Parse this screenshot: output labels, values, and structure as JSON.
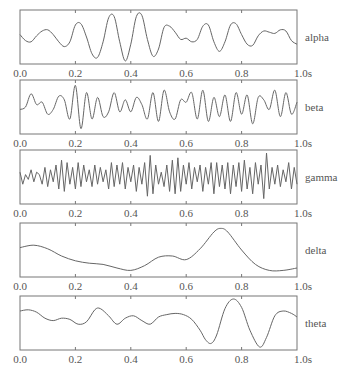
{
  "chart_data": {
    "type": "line",
    "title": "",
    "xlabel": "",
    "ylabel": "",
    "x_unit": "s",
    "xlim": [
      0.0,
      1.0
    ],
    "x_ticks": [
      0.0,
      0.2,
      0.4,
      0.6,
      0.8,
      1.0
    ],
    "x_tick_labels": [
      "0.0",
      "0.2",
      "0.4",
      "0.6",
      "0.8",
      "1.0s"
    ],
    "grid": false,
    "legend": "right-side labels per panel",
    "line_color": "#666666",
    "series": [
      {
        "name": "alpha",
        "x": [
          0.0,
          0.02,
          0.04,
          0.06,
          0.08,
          0.1,
          0.12,
          0.14,
          0.16,
          0.18,
          0.2,
          0.22,
          0.24,
          0.26,
          0.28,
          0.3,
          0.32,
          0.34,
          0.36,
          0.38,
          0.4,
          0.42,
          0.44,
          0.46,
          0.48,
          0.5,
          0.52,
          0.54,
          0.56,
          0.58,
          0.6,
          0.62,
          0.64,
          0.66,
          0.68,
          0.7,
          0.72,
          0.74,
          0.76,
          0.78,
          0.8,
          0.82,
          0.84,
          0.86,
          0.88,
          0.9,
          0.92,
          0.94,
          0.96,
          0.98,
          1.0
        ],
        "values": [
          0.1,
          -0.15,
          -0.2,
          0.05,
          0.25,
          0.3,
          0.1,
          -0.2,
          -0.4,
          -0.2,
          0.5,
          0.55,
          0.0,
          -0.7,
          -0.85,
          -0.2,
          0.8,
          0.85,
          -0.2,
          -1.0,
          -0.3,
          0.85,
          0.9,
          -0.1,
          -0.8,
          -0.5,
          0.4,
          0.45,
          0.2,
          -0.1,
          -0.05,
          -0.2,
          -0.1,
          0.45,
          0.5,
          -0.2,
          -0.6,
          -0.2,
          0.5,
          0.55,
          0.1,
          -0.3,
          -0.35,
          0.05,
          0.25,
          0.2,
          0.15,
          0.3,
          0.25,
          -0.15,
          -0.3
        ]
      },
      {
        "name": "beta",
        "x": [
          0.0,
          0.02,
          0.04,
          0.06,
          0.08,
          0.1,
          0.12,
          0.14,
          0.16,
          0.18,
          0.2,
          0.22,
          0.24,
          0.26,
          0.28,
          0.3,
          0.32,
          0.34,
          0.36,
          0.38,
          0.4,
          0.42,
          0.44,
          0.46,
          0.48,
          0.5,
          0.52,
          0.54,
          0.56,
          0.58,
          0.6,
          0.62,
          0.64,
          0.66,
          0.68,
          0.7,
          0.72,
          0.74,
          0.76,
          0.78,
          0.8,
          0.82,
          0.84,
          0.86,
          0.88,
          0.9,
          0.92,
          0.94,
          0.96,
          0.98,
          1.0
        ],
        "values": [
          -0.1,
          0.0,
          0.55,
          0.1,
          0.2,
          -0.3,
          -0.1,
          0.45,
          0.3,
          -0.5,
          0.9,
          -0.9,
          0.6,
          -0.5,
          0.4,
          -0.4,
          -0.2,
          0.6,
          -0.2,
          0.3,
          -0.2,
          0.4,
          0.1,
          -0.5,
          0.6,
          -0.6,
          0.7,
          -0.2,
          -0.5,
          0.3,
          0.2,
          0.6,
          -0.5,
          0.7,
          -0.6,
          0.4,
          -0.4,
          0.5,
          -0.6,
          0.6,
          -0.3,
          0.5,
          -0.7,
          0.4,
          0.3,
          -0.1,
          0.7,
          -0.4,
          0.6,
          -0.3,
          0.2
        ]
      },
      {
        "name": "gamma",
        "x": [
          0.0,
          0.01,
          0.02,
          0.03,
          0.04,
          0.05,
          0.06,
          0.07,
          0.08,
          0.09,
          0.1,
          0.11,
          0.12,
          0.13,
          0.14,
          0.15,
          0.16,
          0.17,
          0.18,
          0.19,
          0.2,
          0.21,
          0.22,
          0.23,
          0.24,
          0.25,
          0.26,
          0.27,
          0.28,
          0.29,
          0.3,
          0.31,
          0.32,
          0.33,
          0.34,
          0.35,
          0.36,
          0.37,
          0.38,
          0.39,
          0.4,
          0.41,
          0.42,
          0.43,
          0.44,
          0.45,
          0.46,
          0.47,
          0.48,
          0.49,
          0.5,
          0.51,
          0.52,
          0.53,
          0.54,
          0.55,
          0.56,
          0.57,
          0.58,
          0.59,
          0.6,
          0.61,
          0.62,
          0.63,
          0.64,
          0.65,
          0.66,
          0.67,
          0.68,
          0.69,
          0.7,
          0.71,
          0.72,
          0.73,
          0.74,
          0.75,
          0.76,
          0.77,
          0.78,
          0.79,
          0.8,
          0.81,
          0.82,
          0.83,
          0.84,
          0.85,
          0.86,
          0.87,
          0.88,
          0.89,
          0.9,
          0.91,
          0.92,
          0.93,
          0.94,
          0.95,
          0.96,
          0.97,
          0.98,
          0.99,
          1.0
        ],
        "values": [
          0.2,
          -0.3,
          0.1,
          -0.1,
          0.3,
          -0.2,
          0.2,
          0.1,
          -0.3,
          0.4,
          -0.4,
          0.3,
          -0.2,
          0.5,
          -0.5,
          0.7,
          -0.6,
          0.6,
          -0.3,
          0.4,
          -0.5,
          0.6,
          -0.4,
          0.5,
          -0.2,
          0.3,
          -0.4,
          0.5,
          -0.3,
          0.4,
          -0.2,
          0.3,
          -0.5,
          0.6,
          -0.4,
          0.5,
          -0.3,
          0.6,
          -0.5,
          0.4,
          -0.2,
          0.5,
          -0.6,
          0.4,
          -0.3,
          0.6,
          -0.8,
          0.9,
          -0.7,
          0.5,
          -0.3,
          0.2,
          -0.4,
          0.5,
          -0.6,
          0.7,
          -0.7,
          0.8,
          -0.6,
          0.5,
          -0.3,
          0.6,
          -0.5,
          0.4,
          -0.2,
          0.5,
          -0.6,
          0.4,
          -0.3,
          0.6,
          -0.7,
          0.6,
          -0.4,
          0.5,
          -0.5,
          0.6,
          -0.7,
          0.5,
          -0.4,
          0.6,
          -0.6,
          0.7,
          -0.5,
          0.4,
          -0.7,
          0.6,
          -0.3,
          0.5,
          -0.9,
          1.0,
          -0.5,
          0.4,
          -0.3,
          0.5,
          -0.4,
          0.3,
          -0.2,
          0.6,
          -0.5,
          0.4,
          -0.3
        ]
      },
      {
        "name": "delta",
        "x": [
          0.0,
          0.05,
          0.1,
          0.15,
          0.2,
          0.25,
          0.3,
          0.35,
          0.4,
          0.45,
          0.5,
          0.55,
          0.6,
          0.65,
          0.7,
          0.725,
          0.75,
          0.8,
          0.85,
          0.9,
          0.95,
          1.0
        ],
        "values": [
          0.1,
          0.2,
          0.05,
          -0.25,
          -0.45,
          -0.55,
          -0.6,
          -0.75,
          -0.85,
          -0.65,
          -0.3,
          -0.25,
          -0.4,
          0.05,
          0.75,
          0.9,
          0.75,
          0.0,
          -0.6,
          -0.85,
          -0.85,
          -0.75
        ]
      },
      {
        "name": "theta",
        "x": [
          0.0,
          0.03,
          0.06,
          0.09,
          0.12,
          0.15,
          0.18,
          0.21,
          0.24,
          0.27,
          0.29,
          0.32,
          0.35,
          0.38,
          0.41,
          0.44,
          0.47,
          0.5,
          0.53,
          0.56,
          0.59,
          0.62,
          0.65,
          0.67,
          0.69,
          0.71,
          0.74,
          0.77,
          0.8,
          0.83,
          0.865,
          0.89,
          0.92,
          0.95,
          0.98,
          1.0
        ],
        "values": [
          0.5,
          0.55,
          0.45,
          0.2,
          0.1,
          0.2,
          0.15,
          -0.05,
          0.05,
          0.55,
          0.6,
          0.3,
          -0.05,
          0.2,
          0.3,
          0.1,
          -0.05,
          0.25,
          0.35,
          0.4,
          0.35,
          0.15,
          -0.3,
          -0.7,
          -0.85,
          -0.5,
          0.6,
          1.0,
          0.65,
          -0.3,
          -1.0,
          -0.6,
          0.3,
          0.5,
          0.4,
          0.25
        ]
      }
    ]
  },
  "panels": [
    {
      "label": "alpha"
    },
    {
      "label": "beta"
    },
    {
      "label": "gamma"
    },
    {
      "label": "delta"
    },
    {
      "label": "theta"
    }
  ]
}
